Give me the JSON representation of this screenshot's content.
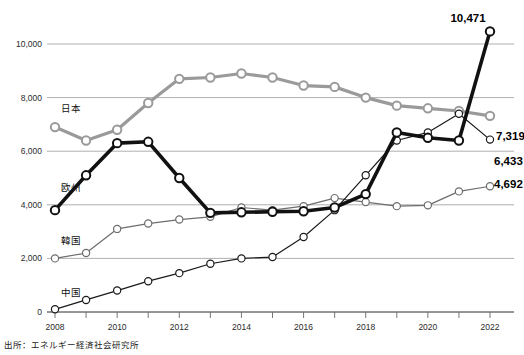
{
  "chart_data": {
    "type": "line",
    "title": "",
    "xlabel": "",
    "ylabel": "",
    "x": [
      2008,
      2009,
      2010,
      2011,
      2012,
      2013,
      2014,
      2015,
      2016,
      2017,
      2018,
      2019,
      2020,
      2021,
      2022
    ],
    "xlim": [
      2008,
      2022
    ],
    "ylim": [
      0,
      10800
    ],
    "y_ticks": [
      0,
      2000,
      4000,
      6000,
      8000,
      10000
    ],
    "y_tick_labels": [
      "0",
      "2,000",
      "4,000",
      "6,000",
      "8,000",
      "10,000"
    ],
    "x_tick_labels": [
      "2008",
      "2010",
      "2012",
      "2014",
      "2016",
      "2018",
      "2020",
      "2022"
    ],
    "x_tick_values": [
      2008,
      2010,
      2012,
      2014,
      2016,
      2018,
      2020,
      2022
    ],
    "grid": true,
    "legend_position": "inline-left",
    "series": [
      {
        "name": "日本",
        "color": "#9a9a9a",
        "line_width": 3.2,
        "label_x": 2008.2,
        "label_y": 7450,
        "end_label": "7,319",
        "values": [
          6900,
          6400,
          6800,
          7800,
          8700,
          8750,
          8900,
          8750,
          8450,
          8400,
          8000,
          7700,
          7600,
          7500,
          7319
        ]
      },
      {
        "name": "欧州",
        "color": "#111111",
        "line_width": 3.6,
        "label_x": 2008.2,
        "label_y": 4500,
        "end_label": "10,471",
        "values": [
          3800,
          5100,
          6300,
          6350,
          5000,
          3700,
          3720,
          3740,
          3760,
          3900,
          4400,
          6700,
          6500,
          6400,
          10471
        ]
      },
      {
        "name": "韓国",
        "color": "#6d6d6d",
        "line_width": 1.2,
        "label_x": 2008.2,
        "label_y": 2550,
        "end_label": "4,692",
        "values": [
          2000,
          2200,
          3100,
          3300,
          3450,
          3550,
          3900,
          3800,
          3950,
          4250,
          4100,
          3950,
          3980,
          4500,
          4692
        ]
      },
      {
        "name": "中国",
        "color": "#1a1a1a",
        "line_width": 1.2,
        "label_x": 2008.2,
        "label_y": 600,
        "end_label": "6,433",
        "values": [
          100,
          450,
          800,
          1150,
          1450,
          1800,
          2000,
          2050,
          2800,
          3800,
          5100,
          6400,
          6700,
          7400,
          6433
        ]
      }
    ]
  },
  "source": {
    "text": "出所：エネルギー経済社会研究所"
  }
}
